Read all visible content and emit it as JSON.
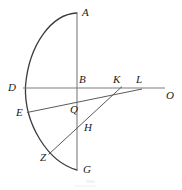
{
  "figure": {
    "title": "",
    "caption": "",
    "canvas": {
      "width": 182,
      "height": 190,
      "background": "#ffffff"
    },
    "style": {
      "stroke_color": "#7d7d7d",
      "arc_stroke_color": "#3a3a3a",
      "label_color": "#1a1a1a",
      "stroke_width": 1,
      "label_font_size_px": 11,
      "label_style": "italic-serif"
    },
    "labels": [
      {
        "id": "A",
        "text": "A",
        "x": 82,
        "y": 7
      },
      {
        "id": "B",
        "text": "B",
        "x": 79,
        "y": 74
      },
      {
        "id": "D",
        "text": "D",
        "x": 8,
        "y": 82
      },
      {
        "id": "E",
        "text": "E",
        "x": 16,
        "y": 107
      },
      {
        "id": "G",
        "text": "G",
        "x": 83,
        "y": 164
      },
      {
        "id": "H",
        "text": "H",
        "x": 84,
        "y": 122
      },
      {
        "id": "K",
        "text": "K",
        "x": 113,
        "y": 74
      },
      {
        "id": "L",
        "text": "L",
        "x": 136,
        "y": 74
      },
      {
        "id": "O",
        "text": "O",
        "x": 166,
        "y": 90
      },
      {
        "id": "Q",
        "text": "Q",
        "x": 70,
        "y": 104
      },
      {
        "id": "Z",
        "text": "Z",
        "x": 40,
        "y": 152
      }
    ],
    "points": [
      {
        "id": "A",
        "x": 77,
        "y": 13,
        "role": "arc-top-endpoint"
      },
      {
        "id": "B",
        "x": 77,
        "y": 88,
        "role": "arc-center"
      },
      {
        "id": "D",
        "x": 25,
        "y": 88,
        "role": "arc-left-extreme"
      },
      {
        "id": "E",
        "x": 27,
        "y": 112,
        "role": "arc-point"
      },
      {
        "id": "G",
        "x": 77,
        "y": 170,
        "role": "arc-bottom-endpoint"
      },
      {
        "id": "H",
        "x": 77,
        "y": 122,
        "role": "intersection-ZK-with-AG"
      },
      {
        "id": "K",
        "x": 118,
        "y": 88,
        "role": "point-on-DO"
      },
      {
        "id": "L",
        "x": 140,
        "y": 88,
        "role": "point-on-DO"
      },
      {
        "id": "O",
        "x": 165,
        "y": 88,
        "role": "ray-endpoint"
      },
      {
        "id": "Q",
        "x": 77,
        "y": 102,
        "role": "intersection-EL-with-AG"
      },
      {
        "id": "Z",
        "x": 50,
        "y": 153,
        "role": "arc-point"
      }
    ],
    "segments": [
      {
        "id": "AG",
        "from": "A",
        "to": "G",
        "x1": 77,
        "y1": 13,
        "x2": 77,
        "y2": 170,
        "kind": "vertical-diameter"
      },
      {
        "id": "DO",
        "from": "D",
        "to": "O",
        "x1": 25,
        "y1": 88,
        "x2": 165,
        "y2": 88,
        "kind": "horizontal-axis"
      },
      {
        "id": "EL",
        "from": "E",
        "to": "L",
        "x1": 27,
        "y1": 112,
        "x2": 141,
        "y2": 89,
        "kind": "secant-through-Q"
      },
      {
        "id": "ZK",
        "from": "Z",
        "to": "K",
        "x1": 49,
        "y1": 154,
        "x2": 121,
        "y2": 87,
        "kind": "secant-through-H"
      }
    ],
    "arcs": [
      {
        "id": "semicircle-ADG",
        "from": "A",
        "through": "D",
        "to": "G",
        "center_x": 77,
        "center_y": 88,
        "radius": 52,
        "direction": "counter-clockwise-left",
        "path": "M 77 13 A 52 75 0 0 0 25 88 A 52 82 0 0 0 77 170"
      }
    ]
  }
}
